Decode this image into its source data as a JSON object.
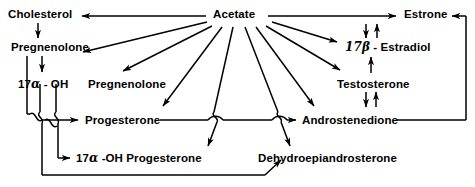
{
  "diagram": {
    "type": "flow-diagram",
    "background_color": "#ffffff",
    "stroke_color": "#000000",
    "nodes": [
      {
        "id": "cholesterol",
        "label": "Cholesterol",
        "x": 8,
        "y": 8
      },
      {
        "id": "acetate",
        "label": "Acetate",
        "x": 213,
        "y": 8
      },
      {
        "id": "estrone",
        "label": "Estrone",
        "x": 404,
        "y": 8
      },
      {
        "id": "pregnenolone",
        "label": "Pregnenolone",
        "x": 11,
        "y": 41
      },
      {
        "id": "estradiol",
        "label": "17β - Estradiol",
        "x": 345,
        "y": 41
      },
      {
        "id": "hydroxy-pregnenolone",
        "label": "17α - OH",
        "x": 18,
        "y": 78
      },
      {
        "id": "pregnenolone-2",
        "label": "Pregnenolone",
        "x": 88,
        "y": 78
      },
      {
        "id": "testosterone",
        "label": "Testosterone",
        "x": 337,
        "y": 78
      },
      {
        "id": "progesterone",
        "label": "Progesterone",
        "x": 85,
        "y": 114
      },
      {
        "id": "androstenedione",
        "label": "Androstenedione",
        "x": 302,
        "y": 114
      },
      {
        "id": "hydroxy-progesterone",
        "label": "17α -OH Progesterone",
        "x": 76,
        "y": 152
      },
      {
        "id": "dehydroepiandrosterone",
        "label": "Dehydroepiandrosterone",
        "x": 258,
        "y": 152
      }
    ],
    "edges": [
      {
        "from": "acetate",
        "to": "cholesterol",
        "kind": "arrow"
      },
      {
        "from": "acetate",
        "to": "estrone",
        "kind": "arrow"
      },
      {
        "from": "cholesterol",
        "to": "pregnenolone",
        "kind": "arrow"
      },
      {
        "from": "acetate",
        "to": "pregnenolone",
        "kind": "arrow"
      },
      {
        "from": "acetate",
        "to": "pregnenolone-2",
        "kind": "arrow"
      },
      {
        "from": "acetate",
        "to": "progesterone",
        "kind": "arrow"
      },
      {
        "from": "acetate",
        "to": "hydroxy-progesterone",
        "kind": "arrow"
      },
      {
        "from": "acetate",
        "to": "dehydroepiandrosterone",
        "kind": "arrow"
      },
      {
        "from": "acetate",
        "to": "androstenedione",
        "kind": "arrow"
      },
      {
        "from": "acetate",
        "to": "testosterone",
        "kind": "arrow"
      },
      {
        "from": "acetate",
        "to": "estradiol",
        "kind": "arrow"
      },
      {
        "from": "pregnenolone",
        "to": "hydroxy-pregnenolone",
        "kind": "arrow"
      },
      {
        "from": "pregnenolone",
        "to": "progesterone",
        "kind": "arrow"
      },
      {
        "from": "hydroxy-pregnenolone",
        "to": "hydroxy-progesterone",
        "kind": "arrow"
      },
      {
        "from": "pregnenolone",
        "to": "dehydroepiandrosterone",
        "kind": "arrow"
      },
      {
        "from": "progesterone",
        "to": "androstenedione",
        "kind": "arrow"
      },
      {
        "from": "testosterone",
        "to": "androstenedione",
        "kind": "double-arrow"
      },
      {
        "from": "testosterone",
        "to": "estradiol",
        "kind": "arrow"
      },
      {
        "from": "estrone",
        "to": "estradiol",
        "kind": "double-arrow"
      },
      {
        "from": "androstenedione",
        "to": "estrone",
        "kind": "arrow"
      }
    ]
  }
}
